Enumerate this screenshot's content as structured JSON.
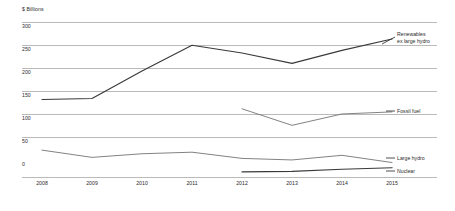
{
  "chart_data": {
    "type": "line",
    "title": "",
    "subtitle": "",
    "xlabel": "",
    "ylabel": "$ Billions",
    "unit_label": "$ Billions",
    "x": [
      2008,
      2009,
      2010,
      2011,
      2012,
      2013,
      2014,
      2015
    ],
    "categories": [
      "2008",
      "2009",
      "2010",
      "2011",
      "2012",
      "2013",
      "2014",
      "2015"
    ],
    "xlim": [
      2008,
      2015
    ],
    "ylim": [
      0,
      300
    ],
    "yticks": [
      0,
      50,
      100,
      150,
      200,
      250,
      300
    ],
    "ytick_labels": [
      "0",
      "50",
      "100",
      "150",
      "200",
      "250",
      "300"
    ],
    "xtick_labels": [
      "2008",
      "2009",
      "2010",
      "2011",
      "2012",
      "2013",
      "2014",
      "2015"
    ],
    "grid": true,
    "grid_axis": "y",
    "legend_position": "right-inline-labels",
    "series": [
      {
        "name": "Renewables ex large hydro",
        "label_line1": "Renewables",
        "label_line2": "ex large hydro",
        "color": "#3a3a3a",
        "x": [
          2008,
          2009,
          2010,
          2011,
          2012,
          2013,
          2014,
          2015
        ],
        "values": [
          150,
          152,
          205,
          255,
          240,
          220,
          245,
          267
        ]
      },
      {
        "name": "Fossil fuel",
        "label_line1": "Fossil fuel",
        "label_line2": "",
        "color": "#6b6b6b",
        "x": [
          2012,
          2013,
          2014,
          2015
        ],
        "values": [
          132,
          100,
          122,
          126
        ]
      },
      {
        "name": "Large hydro",
        "label_line1": "Large hydro",
        "label_line2": "",
        "color": "#6b6b6b",
        "x": [
          2008,
          2009,
          2010,
          2011,
          2012,
          2013,
          2014,
          2015
        ],
        "values": [
          52,
          38,
          45,
          48,
          36,
          33,
          42,
          28
        ]
      },
      {
        "name": "Nuclear",
        "label_line1": "Nuclear",
        "label_line2": "",
        "color": "#3a3a3a",
        "x": [
          2012,
          2013,
          2014,
          2015
        ],
        "values": [
          10,
          11,
          15,
          18
        ]
      }
    ]
  },
  "axis": {
    "unit_label": "$ Billions",
    "y_labels": [
      "300",
      "250",
      "200",
      "150",
      "100",
      "50",
      "0"
    ],
    "x_labels": [
      "2008",
      "2009",
      "2010",
      "2011",
      "2012",
      "2013",
      "2014",
      "2015"
    ]
  },
  "labels": {
    "renewables_line1": "Renewables",
    "renewables_line2": "ex large hydro",
    "fossil_fuel": "Fossil fuel",
    "large_hydro": "Large hydro",
    "nuclear": "Nuclear"
  },
  "colors": {
    "series_dark": "#3a3a3a",
    "series_light": "#6b6b6b",
    "gridline": "#8c8c8c",
    "text": "#2b2b2b",
    "background": "#ffffff"
  }
}
